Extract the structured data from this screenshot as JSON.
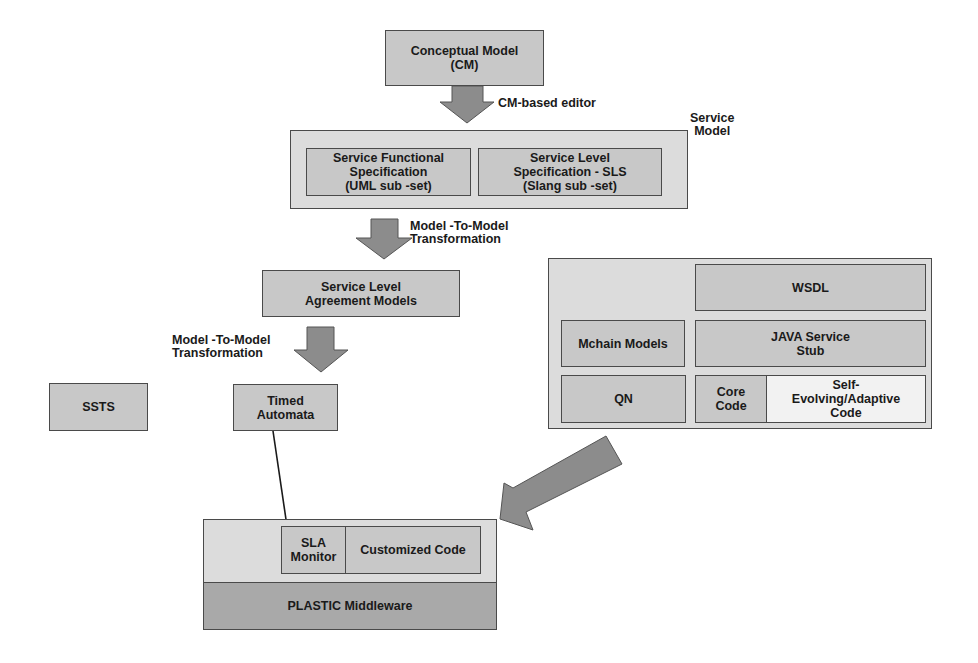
{
  "colors": {
    "box_fill": "#c8c8c8",
    "container_fill": "#dcdcdc",
    "highlight_fill": "#f2f2f2",
    "middleware_fill": "#a9a9a9",
    "arrow_fill": "#8c8c8c",
    "border": "#4a4a4a"
  },
  "nodes": {
    "conceptual_model": "Conceptual Model\n(CM)",
    "service_model_label": "Service\nModel",
    "service_functional_spec": "Service Functional\nSpecification\n(UML sub -set)",
    "service_level_spec": "Service Level\nSpecification   - SLS\n(Slang sub -set)",
    "sla_models": "Service Level\nAgreement Models",
    "timed_automata": "Timed\nAutomata",
    "ssts": "SSTS",
    "wsdl": "WSDL",
    "mchain_models": "Mchain Models",
    "java_stub": "JAVA Service\nStub",
    "qn": "QN",
    "core_code": "Core\nCode",
    "self_evolving": "Self-\nEvolving/Adaptive\nCode",
    "sla_monitor": "SLA\nMonitor",
    "customized_code": "Customized Code",
    "plastic_middleware": "PLASTIC Middleware"
  },
  "edges": {
    "cm_editor": "CM-based editor",
    "m2m_1": "Model -To-Model\nTransformation",
    "m2m_2": "Model -To-Model\nTransformation"
  }
}
